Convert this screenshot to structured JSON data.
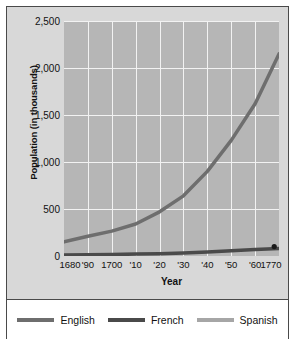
{
  "chart_data": {
    "type": "line",
    "title": "",
    "xlabel": "Year",
    "ylabel": "Population (in thousands)",
    "xlim": [
      1680,
      1770
    ],
    "ylim": [
      0,
      2500
    ],
    "grid": true,
    "legend_position": "bottom",
    "yticks": [
      "2,500",
      "2,000",
      "1,500",
      "1,000",
      "500",
      "0"
    ],
    "ytick_values": [
      2500,
      2000,
      1500,
      1000,
      500,
      0
    ],
    "xticks": [
      "1680",
      "'90",
      "1700",
      "'10",
      "'20",
      "'30",
      "'40",
      "'50",
      "'60",
      "1770"
    ],
    "xtick_values": [
      1680,
      1690,
      1700,
      1710,
      1720,
      1730,
      1740,
      1750,
      1760,
      1770
    ],
    "x": [
      1680,
      1690,
      1700,
      1710,
      1720,
      1730,
      1740,
      1750,
      1760,
      1770
    ],
    "series": [
      {
        "name": "English",
        "color": "#6e6e6e",
        "values": [
          150,
          210,
          265,
          340,
          470,
          640,
          900,
          1230,
          1620,
          2150
        ]
      },
      {
        "name": "French",
        "color": "#4a4a4a",
        "values": [
          10,
          13,
          16,
          20,
          25,
          32,
          42,
          55,
          70,
          80
        ]
      },
      {
        "name": "Spanish",
        "color": "#a6a6a6",
        "values": [
          null,
          null,
          null,
          null,
          null,
          null,
          null,
          null,
          null,
          100
        ]
      }
    ],
    "markers": [
      {
        "name": "spanish-point",
        "x": 1768,
        "y": 100,
        "color": "#1a1a1a"
      }
    ]
  },
  "legend": {
    "items": [
      {
        "label": "English",
        "color": "#6e6e6e"
      },
      {
        "label": "French",
        "color": "#4a4a4a"
      },
      {
        "label": "Spanish",
        "color": "#a6a6a6"
      }
    ]
  },
  "colors": {
    "figure_background": "#d8d8d8",
    "plot_background": "#b6b6b6",
    "gridline": "#f2f2f2",
    "border": "#4a4a4a",
    "text": "#111111"
  }
}
